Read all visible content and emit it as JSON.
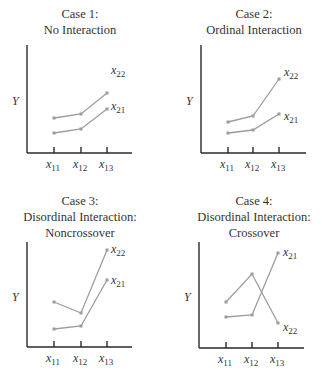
{
  "chart_data": [
    {
      "type": "line",
      "title": "Case 1:\nNo Interaction",
      "title_lines": [
        "Case 1:",
        "No Interaction"
      ],
      "ylabel": "Y",
      "categories": [
        "x11",
        "x12",
        "x13"
      ],
      "series": [
        {
          "name": "x22",
          "values": [
            35,
            39,
            60
          ]
        },
        {
          "name": "x21",
          "values": [
            20,
            24,
            44
          ]
        }
      ],
      "grid": false,
      "ylim": [
        0,
        100
      ]
    },
    {
      "type": "line",
      "title": "Case 2:\nOrdinal Interaction",
      "title_lines": [
        "Case 2:",
        "Ordinal Interaction"
      ],
      "ylabel": "Y",
      "categories": [
        "x11",
        "x12",
        "x13"
      ],
      "series": [
        {
          "name": "x22",
          "values": [
            31,
            37,
            74
          ]
        },
        {
          "name": "x21",
          "values": [
            20,
            23,
            39
          ]
        }
      ],
      "grid": false,
      "ylim": [
        0,
        100
      ]
    },
    {
      "type": "line",
      "title": "Case 3:\nDisordinal Interaction:\nNoncrossover",
      "title_lines": [
        "Case 3:",
        "Disordinal Interaction:",
        "Noncrossover"
      ],
      "ylabel": "Y",
      "categories": [
        "x11",
        "x12",
        "x13"
      ],
      "series": [
        {
          "name": "x22",
          "values": [
            45,
            34,
            97
          ]
        },
        {
          "name": "x21",
          "values": [
            18,
            21,
            67
          ]
        }
      ],
      "grid": false,
      "ylim": [
        0,
        100
      ]
    },
    {
      "type": "line",
      "title": "Case 4:\nDisordinal Interaction:\nCrossover",
      "title_lines": [
        "Case 4:",
        "Disordinal Interaction:",
        "Crossover"
      ],
      "ylabel": "Y",
      "categories": [
        "x11",
        "x12",
        "x13"
      ],
      "series": [
        {
          "name": "x22",
          "values": [
            46,
            74,
            25
          ]
        },
        {
          "name": "x21",
          "values": [
            31,
            33,
            95
          ]
        }
      ],
      "grid": false,
      "ylim": [
        0,
        100
      ]
    }
  ],
  "colors": {
    "line": "#9c9c9c",
    "axis": "#2a2a2a",
    "text": "#333333"
  },
  "layout": {
    "panels": [
      {
        "ox": 27,
        "axisTop": 45,
        "axisY": 153,
        "axisRight": 132,
        "ticks": [
          54,
          81,
          107
        ],
        "titleX": 80,
        "titleY": 6
      },
      {
        "ox": 201,
        "axisTop": 45,
        "axisY": 153,
        "axisRight": 306,
        "ticks": [
          228,
          253,
          279
        ],
        "titleX": 254,
        "titleY": 6
      },
      {
        "ox": 27,
        "axisTop": 242,
        "axisY": 347,
        "axisRight": 132,
        "ticks": [
          54,
          81,
          107
        ],
        "titleX": 80,
        "titleY": 193
      },
      {
        "ox": 199,
        "axisTop": 242,
        "axisY": 348,
        "axisRight": 304,
        "ticks": [
          226,
          252,
          278
        ],
        "titleX": 254,
        "titleY": 193
      }
    ],
    "points_px": [
      {
        "x22": [
          118,
          114,
          93
        ],
        "x21": [
          133,
          129,
          109
        ],
        "lbl": {
          "x22": [
            111,
            74
          ],
          "x21": [
            111,
            110
          ]
        }
      },
      {
        "x22": [
          122,
          116,
          79
        ],
        "x21": [
          133,
          130,
          114
        ],
        "lbl": {
          "x22": [
            284,
            76
          ],
          "x21": [
            284,
            120
          ]
        }
      },
      {
        "x22": [
          302,
          313,
          250
        ],
        "x21": [
          329,
          326,
          280
        ],
        "lbl": {
          "x22": [
            111,
            253
          ],
          "x21": [
            111,
            284
          ]
        }
      },
      {
        "x22": [
          302,
          274,
          323
        ],
        "x21": [
          317,
          315,
          253
        ],
        "lbl": {
          "x21": [
            283,
            256
          ],
          "x22": [
            283,
            331
          ]
        }
      }
    ]
  }
}
